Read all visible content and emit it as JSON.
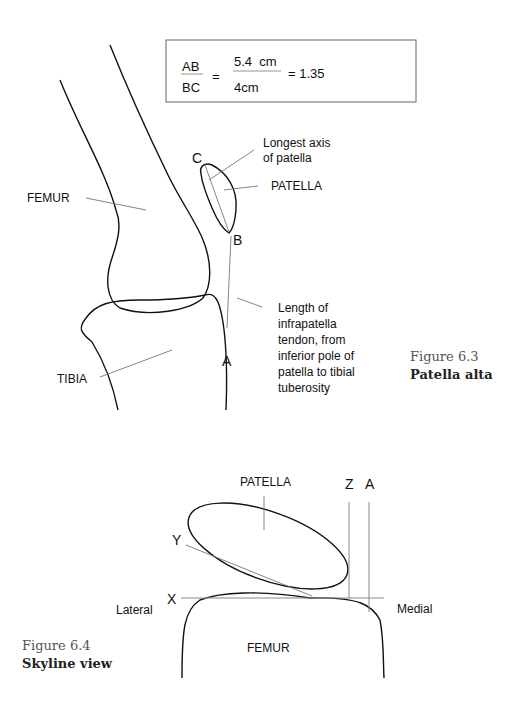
{
  "figure_6_3": {
    "equation": {
      "numerator_label": "AB",
      "denominator_label": "BC",
      "equals": "=",
      "numerator_value": "5.4  cm",
      "denominator_value": "4cm",
      "result": "= 1.35"
    },
    "labels": {
      "femur": "FEMUR",
      "tibia": "TIBIA",
      "patella": "PATELLA",
      "point_a": "A",
      "point_b": "B",
      "point_c": "C",
      "longest_axis_line1": "Longest axis",
      "longest_axis_line2": "of patella",
      "tendon_line1": "Length of",
      "tendon_line2": "infrapatella",
      "tendon_line3": "tendon, from",
      "tendon_line4": "inferior pole of",
      "tendon_line5": "patella to tibial",
      "tendon_line6": "tuberosity"
    },
    "caption": {
      "number": "Figure 6.3",
      "title": "Patella alta"
    }
  },
  "figure_6_4": {
    "labels": {
      "patella": "PATELLA",
      "femur": "FEMUR",
      "lateral": "Lateral",
      "medial": "Medial",
      "point_x": "X",
      "point_y": "Y",
      "point_z": "Z",
      "point_a": "A"
    },
    "caption": {
      "number": "Figure 6.4",
      "title": "Skyline view"
    }
  }
}
